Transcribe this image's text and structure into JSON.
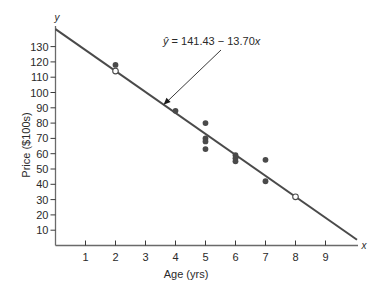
{
  "chart_data": {
    "type": "scatter",
    "title": "",
    "xlabel": "Age (yrs)",
    "ylabel": "Price ($100s)",
    "x_axis_var": "x",
    "y_axis_var": "y",
    "xlim": [
      0,
      10
    ],
    "ylim": [
      0,
      140
    ],
    "x_ticks": [
      1,
      2,
      3,
      4,
      5,
      6,
      7,
      8,
      9
    ],
    "y_ticks": [
      10,
      20,
      30,
      40,
      50,
      60,
      70,
      80,
      90,
      100,
      110,
      120,
      130
    ],
    "grid": false,
    "legend": null,
    "series": [
      {
        "name": "Observed",
        "marker": "filled-circle",
        "points": [
          {
            "x": 2,
            "y": 118
          },
          {
            "x": 4,
            "y": 88
          },
          {
            "x": 5,
            "y": 80
          },
          {
            "x": 5,
            "y": 70
          },
          {
            "x": 5,
            "y": 68
          },
          {
            "x": 5,
            "y": 63
          },
          {
            "x": 6,
            "y": 59
          },
          {
            "x": 6,
            "y": 57
          },
          {
            "x": 6,
            "y": 55
          },
          {
            "x": 7,
            "y": 56
          },
          {
            "x": 7,
            "y": 42
          }
        ]
      },
      {
        "name": "Fitted (marked)",
        "marker": "open-circle",
        "points": [
          {
            "x": 2,
            "y": 114.03
          },
          {
            "x": 8,
            "y": 31.83
          }
        ]
      }
    ],
    "regression_line": {
      "intercept": 141.43,
      "slope": -13.7,
      "x_start": 0,
      "x_end": 10.05
    },
    "annotations": [
      {
        "text_hat": "ŷ",
        "text_rest": " = 141.43 − 13.70",
        "text_var": "x",
        "points_to": {
          "x": 3.6,
          "y": 92
        }
      }
    ]
  }
}
